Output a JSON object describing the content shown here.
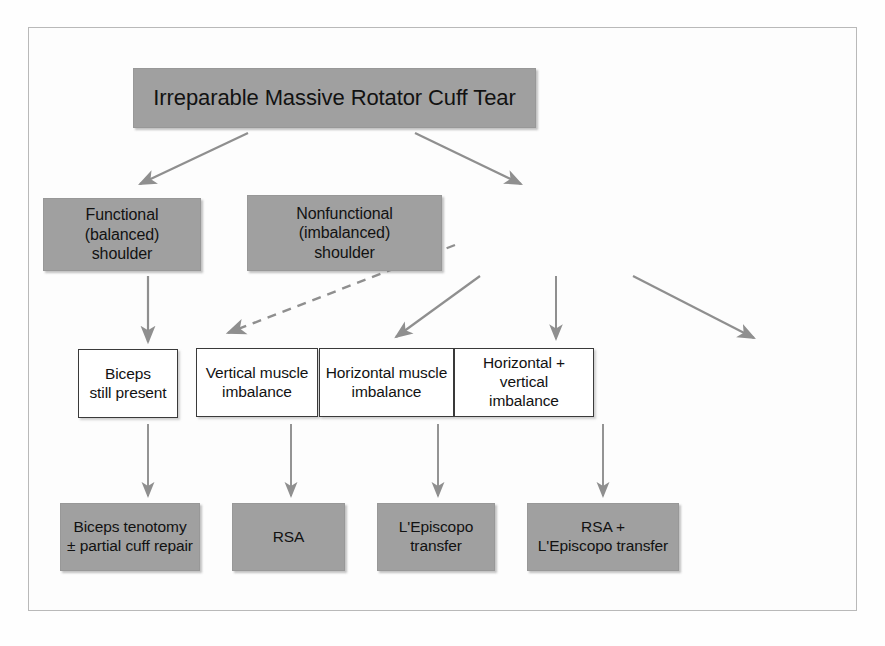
{
  "figure": {
    "colors": {
      "filled_box_fill": "#a0a0a0",
      "filled_box_border": "#989898",
      "outlined_box_fill": "#ffffff",
      "outlined_box_border": "#3a3a3a",
      "connector": "#8f8f8f",
      "frame_border": "#b9b9b9",
      "page_background": "#fefefe",
      "text": "#121212"
    }
  },
  "nodes": {
    "root": {
      "label": "Irreparable Massive Rotator Cuff Tear",
      "style": "filled"
    },
    "functional": {
      "line1": "Functional (balanced)",
      "line2": "shoulder",
      "style": "filled"
    },
    "nonfunctional": {
      "line1": "Nonfunctional (imbalanced)",
      "line2": "shoulder",
      "style": "filled"
    },
    "biceps_present": {
      "line1": "Biceps",
      "line2": "still present",
      "style": "outlined"
    },
    "vertical_imbalance": {
      "line1": "Vertical muscle",
      "line2": "imbalance",
      "style": "outlined"
    },
    "horizontal_imbalance": {
      "line1": "Horizontal muscle",
      "line2": "imbalance",
      "style": "outlined"
    },
    "horizontal_vertical_imbalance": {
      "line1": "Horizontal + vertical",
      "line2": "imbalance",
      "style": "outlined"
    },
    "biceps_tenotomy": {
      "line1": "Biceps tenotomy",
      "line2": "± partial cuff repair",
      "style": "filled"
    },
    "rsa": {
      "line1": "RSA",
      "line2": "",
      "style": "filled"
    },
    "lepiscopo": {
      "line1": "L'Episcopo",
      "line2": "transfer",
      "style": "filled"
    },
    "rsa_lepiscopo": {
      "line1": "RSA +",
      "line2": "L'Episcopo transfer",
      "style": "filled"
    }
  },
  "edges": [
    {
      "from": "root",
      "to": "functional",
      "style": "solid",
      "kind": "diagonal-left"
    },
    {
      "from": "root",
      "to": "nonfunctional",
      "style": "solid",
      "kind": "diagonal-right"
    },
    {
      "from": "functional",
      "to": "biceps_present",
      "style": "solid",
      "kind": "vertical"
    },
    {
      "from": "nonfunctional",
      "to": "biceps_present",
      "style": "dashed",
      "kind": "diagonal-left"
    },
    {
      "from": "nonfunctional",
      "to": "vertical_imbalance",
      "style": "solid",
      "kind": "diagonal-left"
    },
    {
      "from": "nonfunctional",
      "to": "horizontal_imbalance",
      "style": "solid",
      "kind": "vertical"
    },
    {
      "from": "nonfunctional",
      "to": "horizontal_vertical_imbalance",
      "style": "solid",
      "kind": "diagonal-right"
    },
    {
      "from": "biceps_present",
      "to": "biceps_tenotomy",
      "style": "solid",
      "kind": "vertical"
    },
    {
      "from": "vertical_imbalance",
      "to": "rsa",
      "style": "solid",
      "kind": "vertical"
    },
    {
      "from": "horizontal_imbalance",
      "to": "lepiscopo",
      "style": "solid",
      "kind": "vertical"
    },
    {
      "from": "horizontal_vertical_imbalance",
      "to": "rsa_lepiscopo",
      "style": "solid",
      "kind": "vertical"
    }
  ]
}
